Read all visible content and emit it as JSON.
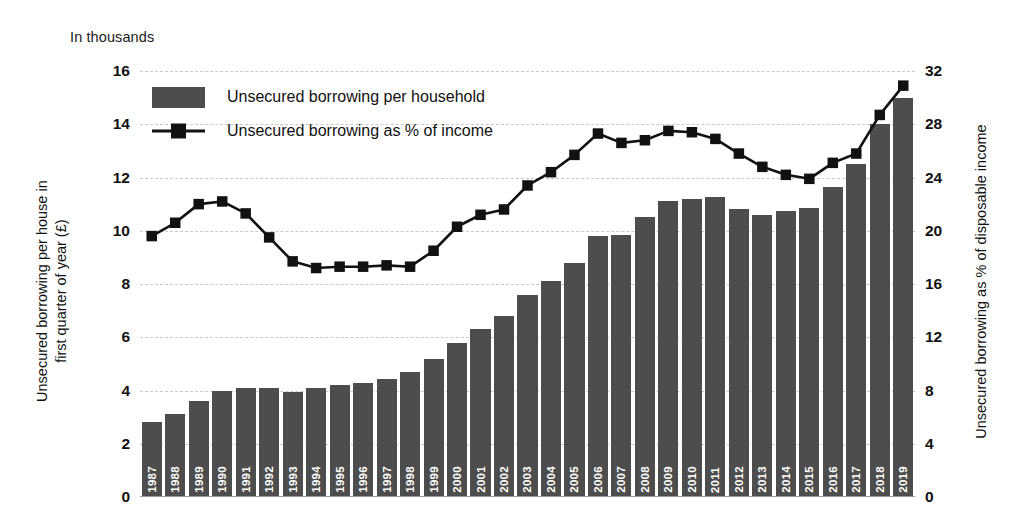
{
  "unit_note": "In thousands",
  "axes": {
    "left_title_line1": "Unsecured borrowing per house in",
    "left_title_line2": "first quarter of year (£)",
    "right_title": "Unsecured borrowing as % of disposable income",
    "left_ticks": [
      "16",
      "14",
      "12",
      "10",
      "8",
      "6",
      "4",
      "2",
      "0"
    ],
    "right_ticks": [
      "32",
      "28",
      "24",
      "20",
      "16",
      "12",
      "8",
      "4",
      "0"
    ]
  },
  "legend": {
    "bar_label": "Unsecured borrowing per household",
    "line_label": "Unsecured borrowing as % of income"
  },
  "colors": {
    "bar": "#4d4d4d",
    "line": "#111111",
    "grid": "#c9c9c9",
    "background": "#ffffff"
  },
  "chart_data": {
    "type": "bar",
    "title": "",
    "subtitle": "In thousands",
    "xlabel": "",
    "ylabel": "Unsecured borrowing per house in first quarter of year (£)",
    "y2label": "Unsecured borrowing as % of disposable income",
    "ylim": [
      0,
      16
    ],
    "y2lim": [
      0,
      32
    ],
    "ytick_step": 2,
    "y2tick_step": 4,
    "grid": true,
    "legend_position": "upper-left-inside",
    "categories": [
      "1987",
      "1988",
      "1989",
      "1990",
      "1991",
      "1992",
      "1993",
      "1994",
      "1995",
      "1996",
      "1997",
      "1998",
      "1999",
      "2000",
      "2001",
      "2002",
      "2003",
      "2004",
      "2005",
      "2006",
      "2007",
      "2008",
      "2009",
      "2010",
      "2011",
      "2012",
      "2013",
      "2014",
      "2015",
      "2016",
      "2017",
      "2018",
      "2019"
    ],
    "series": [
      {
        "name": "Unsecured borrowing per household",
        "type": "bar",
        "axis": "left",
        "unit": "thousand £",
        "values": [
          2.8,
          3.1,
          3.6,
          4.0,
          4.1,
          4.1,
          3.95,
          4.1,
          4.2,
          4.3,
          4.45,
          4.7,
          5.2,
          5.8,
          6.3,
          6.8,
          7.6,
          8.1,
          8.8,
          9.8,
          9.85,
          10.5,
          11.1,
          11.2,
          11.25,
          10.8,
          10.6,
          10.75,
          10.85,
          11.65,
          12.5,
          14.0,
          15.0
        ]
      },
      {
        "name": "Unsecured borrowing as % of income",
        "type": "line",
        "axis": "right",
        "unit": "%",
        "values": [
          19.6,
          20.6,
          22.0,
          22.2,
          21.3,
          19.5,
          17.7,
          17.2,
          17.3,
          17.3,
          17.4,
          17.3,
          18.5,
          20.3,
          21.2,
          21.6,
          23.4,
          24.4,
          25.7,
          27.3,
          26.6,
          26.8,
          27.5,
          27.4,
          26.9,
          25.8,
          24.8,
          24.2,
          23.9,
          25.1,
          25.8,
          28.7,
          30.9
        ]
      }
    ]
  }
}
